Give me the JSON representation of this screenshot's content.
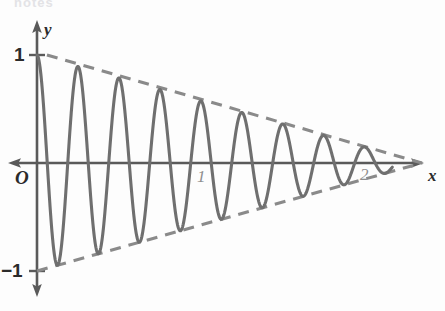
{
  "figure": {
    "background_color": "#fdfdfd",
    "cropped_header_text": "notes",
    "width": 445,
    "height": 311
  },
  "labels": {
    "y_axis_name": "y",
    "x_axis_name": "x",
    "origin": "O",
    "y_tick_top": "1",
    "y_tick_bottom": "−1",
    "x_tick_one": "1",
    "x_tick_two": "2"
  },
  "colors": {
    "curve": "#6f6f6f",
    "envelope": "#8a8a8a",
    "axis": "#5a5a5a",
    "text": "#2b2b2b",
    "faint_text": "#8e8e8e"
  },
  "geometry": {
    "origin_px": {
      "x": 37,
      "y": 163
    },
    "x_unit_px": 163,
    "y_unit_px": 108,
    "x_axis_left_px": 8,
    "x_axis_right_px": 424,
    "y_axis_top_px": 20,
    "y_axis_bottom_px": 297,
    "curve_end_px": 392,
    "envelope_vanish_px": 422
  },
  "chart_data": {
    "type": "line",
    "title": "",
    "subtitle": "",
    "xlabel": "x",
    "ylabel": "y",
    "xlim": [
      -0.18,
      2.37
    ],
    "ylim": [
      -1.42,
      1.32
    ],
    "xticks": [
      1,
      2
    ],
    "xticklabels": [
      "1",
      "2"
    ],
    "yticks": [
      1,
      -1
    ],
    "yticklabels": [
      "1",
      "−1"
    ],
    "grid": false,
    "legend": null,
    "legend_position": "none",
    "axes_style": "arrows-both-ends",
    "series": [
      {
        "name": "damped oscillation",
        "type": "line",
        "style": "solid",
        "color": "#6f6f6f",
        "linewidth": 3,
        "formula": "y = (1 - x/2.36) * cos(2*pi*x/0.2515)",
        "period": 0.2515,
        "cycles_visible": 10,
        "x_start": 0,
        "x_end": 2.18,
        "peaks": [
          {
            "x": 0.061,
            "y": 1.0
          },
          {
            "x": 0.313,
            "y": 0.867
          },
          {
            "x": 0.558,
            "y": 0.764
          },
          {
            "x": 0.816,
            "y": 0.655
          },
          {
            "x": 1.073,
            "y": 0.546
          },
          {
            "x": 1.325,
            "y": 0.439
          },
          {
            "x": 1.576,
            "y": 0.333
          },
          {
            "x": 1.828,
            "y": 0.225
          },
          {
            "x": 2.08,
            "y": 0.119
          }
        ],
        "troughs": [
          {
            "x": 0.202,
            "y": -0.926
          },
          {
            "x": 0.454,
            "y": -0.806
          },
          {
            "x": 0.705,
            "y": -0.701
          },
          {
            "x": 0.951,
            "y": -0.597
          },
          {
            "x": 1.202,
            "y": -0.491
          },
          {
            "x": 1.454,
            "y": -0.384
          },
          {
            "x": 1.706,
            "y": -0.278
          },
          {
            "x": 1.957,
            "y": -0.172
          },
          {
            "x": 2.153,
            "y": -0.088
          }
        ]
      },
      {
        "name": "upper envelope",
        "type": "line",
        "style": "dashed",
        "color": "#8a8a8a",
        "linewidth": 3,
        "points": [
          {
            "x": 0.061,
            "y": 1.0
          },
          {
            "x": 2.362,
            "y": 0.0
          }
        ]
      },
      {
        "name": "lower envelope",
        "type": "line",
        "style": "dashed",
        "color": "#8a8a8a",
        "linewidth": 3,
        "points": [
          {
            "x": 0.0,
            "y": -1.0
          },
          {
            "x": 2.362,
            "y": 0.0
          }
        ]
      }
    ]
  }
}
